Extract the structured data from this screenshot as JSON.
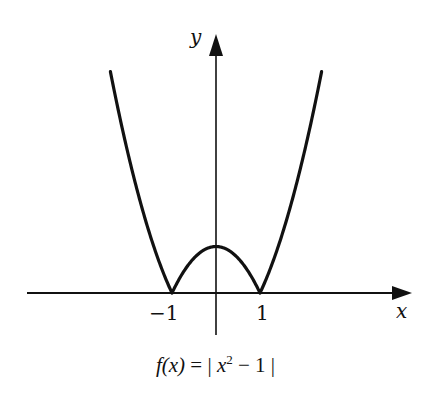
{
  "figure": {
    "axis_labels": {
      "x": "x",
      "y": "y"
    },
    "tick_labels": {
      "neg_one": "−1",
      "pos_one": "1"
    },
    "caption": {
      "lhs": "f(x)",
      "equals": "=",
      "bar_open": "|",
      "base": "x",
      "exponent": "2",
      "rest": " − 1",
      "bar_close": "|"
    },
    "colors": {
      "ink": "#111111",
      "background": "#ffffff"
    }
  },
  "chart_data": {
    "type": "line",
    "function": "|x^2 - 1|",
    "xlabel": "x",
    "ylabel": "y",
    "x_ticks": [
      -1,
      1
    ],
    "xlim": [
      -4.3,
      4.4
    ],
    "ylim": [
      -0.9,
      5.6
    ],
    "grid": false,
    "legend": null,
    "series": [
      {
        "name": "f(x) = |x² − 1|",
        "x": [
          -2.4,
          -2.0,
          -1.5,
          -1.0,
          -0.5,
          0.0,
          0.5,
          1.0,
          1.5,
          2.0,
          2.4
        ],
        "y": [
          4.76,
          3.0,
          1.25,
          0.0,
          0.75,
          1.0,
          0.75,
          0.0,
          1.25,
          3.0,
          4.76
        ]
      }
    ],
    "annotations": [
      {
        "text": "−1",
        "at": [
          -1,
          0
        ]
      },
      {
        "text": "1",
        "at": [
          1,
          0
        ]
      }
    ]
  }
}
